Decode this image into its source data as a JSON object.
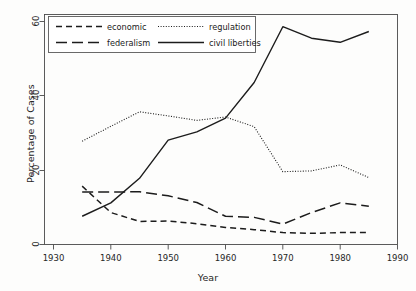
{
  "chart_data": {
    "type": "line",
    "title": "",
    "xlabel": "Year",
    "ylabel": "Percentage of Cases",
    "xlim": [
      1930,
      1990
    ],
    "ylim": [
      0,
      60
    ],
    "xticks": [
      1930,
      1940,
      1950,
      1960,
      1970,
      1980,
      1990
    ],
    "yticks": [
      0,
      20,
      40,
      60
    ],
    "grid": false,
    "legend_position": "top-left",
    "x": [
      1935,
      1940,
      1945,
      1950,
      1955,
      1960,
      1965,
      1970,
      1975,
      1980,
      1985
    ],
    "series": [
      {
        "name": "economic",
        "style": "short-dash",
        "values": [
          15.7,
          8.6,
          6.2,
          6.3,
          5.6,
          4.6,
          4.0,
          3.2,
          3.0,
          3.2,
          3.2
        ]
      },
      {
        "name": "federalism",
        "style": "long-dash",
        "values": [
          14.1,
          14.1,
          14.2,
          13.1,
          11.3,
          7.6,
          7.3,
          5.5,
          8.6,
          11.2,
          10.3
        ]
      },
      {
        "name": "regulation",
        "style": "dotted",
        "values": [
          27.8,
          31.8,
          35.7,
          34.6,
          33.4,
          34.3,
          31.7,
          19.6,
          19.8,
          21.4,
          18.0
        ]
      },
      {
        "name": "civil liberties",
        "style": "solid",
        "values": [
          7.6,
          11.2,
          17.8,
          28.1,
          30.3,
          34.0,
          43.6,
          58.6,
          55.5,
          54.4,
          57.3
        ]
      }
    ]
  },
  "axes": {
    "y_title": "Percentage of Cases",
    "x_title": "Year",
    "x_tick_labels": [
      "1930",
      "1940",
      "1950",
      "1960",
      "1970",
      "1980",
      "1990"
    ],
    "y_tick_labels": [
      "0",
      "20",
      "40",
      "60"
    ]
  },
  "legend": {
    "entries": [
      {
        "label": "economic",
        "style": "short-dash"
      },
      {
        "label": "regulation",
        "style": "dotted"
      },
      {
        "label": "federalism",
        "style": "long-dash"
      },
      {
        "label": "civil liberties",
        "style": "solid"
      }
    ]
  },
  "colors": {
    "line": "#1c1c1c",
    "frame": "#4a4a4a",
    "background": "#fdfdfc"
  }
}
